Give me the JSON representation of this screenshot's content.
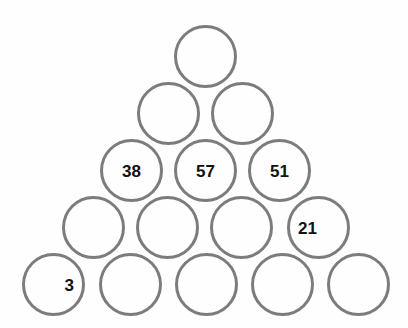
{
  "puzzle": {
    "title": "Number Pyramid",
    "type": "circle-pyramid",
    "background_color": "#fefefe",
    "circle_stroke_color": "#7c7c7c",
    "circle_fill_color": "transparent",
    "label_color": "#111111",
    "circle_diameter": 63,
    "stroke_width": 3,
    "row_count": 5,
    "rows": [
      {
        "index": 0,
        "cell_count": 1,
        "top": 25,
        "cells": [
          {
            "id": "r0c0",
            "value": "",
            "left": 174,
            "label_align": "center",
            "filled": false
          }
        ]
      },
      {
        "index": 1,
        "cell_count": 2,
        "top": 82,
        "cells": [
          {
            "id": "r1c0",
            "value": "",
            "left": 137,
            "label_align": "center",
            "filled": false
          },
          {
            "id": "r1c1",
            "value": "",
            "left": 211,
            "label_align": "center",
            "filled": false
          }
        ]
      },
      {
        "index": 2,
        "cell_count": 3,
        "top": 139,
        "cells": [
          {
            "id": "r2c0",
            "value": "38",
            "left": 100,
            "label_align": "center",
            "filled": true
          },
          {
            "id": "r2c1",
            "value": "57",
            "left": 174,
            "label_align": "center",
            "filled": true
          },
          {
            "id": "r2c2",
            "value": "51",
            "left": 248,
            "label_align": "center",
            "filled": true
          }
        ]
      },
      {
        "index": 3,
        "cell_count": 4,
        "top": 196,
        "cells": [
          {
            "id": "r3c0",
            "value": "",
            "left": 62,
            "label_align": "center",
            "filled": false
          },
          {
            "id": "r3c1",
            "value": "",
            "left": 136,
            "label_align": "center",
            "filled": false
          },
          {
            "id": "r3c2",
            "value": "",
            "left": 210,
            "label_align": "center",
            "filled": false
          },
          {
            "id": "r3c3",
            "value": "21",
            "left": 287,
            "label_align": "left",
            "filled": true
          }
        ]
      },
      {
        "index": 4,
        "cell_count": 5,
        "top": 253,
        "cells": [
          {
            "id": "r4c0",
            "value": "3",
            "left": 22,
            "label_align": "right",
            "filled": true
          },
          {
            "id": "r4c1",
            "value": "",
            "left": 99,
            "label_align": "center",
            "filled": false
          },
          {
            "id": "r4c2",
            "value": "",
            "left": 175,
            "label_align": "center",
            "filled": false
          },
          {
            "id": "r4c3",
            "value": "",
            "left": 251,
            "label_align": "center",
            "filled": false
          },
          {
            "id": "r4c4",
            "value": "",
            "left": 327,
            "label_align": "center",
            "filled": false
          }
        ]
      }
    ],
    "given_values": [
      "38",
      "57",
      "51",
      "21",
      "3"
    ]
  }
}
